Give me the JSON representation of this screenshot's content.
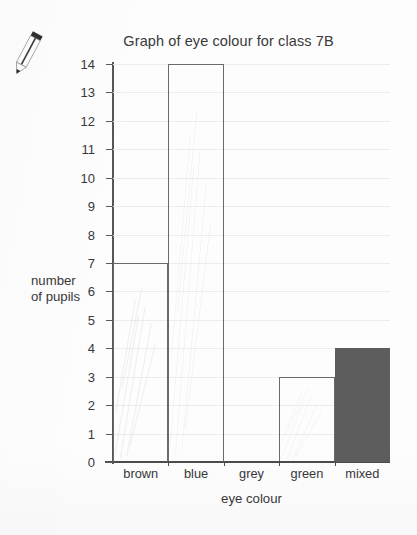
{
  "page": {
    "background_color": "#fdfdfd",
    "doodle_icon": "pencil-icon"
  },
  "chart_data": {
    "type": "bar",
    "title": "Graph of eye colour for class 7B",
    "xlabel": "eye colour",
    "ylabel_line1": "number",
    "ylabel_line2": "of pupils",
    "ylabel": "number of pupils",
    "categories": [
      "brown",
      "blue",
      "grey",
      "green",
      "mixed"
    ],
    "values": [
      7,
      14,
      0,
      3,
      4
    ],
    "ylim": [
      0,
      14
    ],
    "yticks": [
      0,
      1,
      2,
      3,
      4,
      5,
      6,
      7,
      8,
      9,
      10,
      11,
      12,
      13,
      14
    ],
    "ytick_labels": [
      "0",
      "1",
      "2",
      "3",
      "4",
      "5",
      "6",
      "7",
      "8",
      "9",
      "10",
      "11",
      "12",
      "13",
      "14"
    ],
    "grid": true,
    "legend": false,
    "bar_styles": [
      {
        "category": "brown",
        "fill": "none",
        "stroke": "#6a6a6c"
      },
      {
        "category": "blue",
        "fill": "none",
        "stroke": "#6a6a6c"
      },
      {
        "category": "grey",
        "fill": "none",
        "stroke": "#6a6a6c"
      },
      {
        "category": "green",
        "fill": "none",
        "stroke": "#6a6a6c"
      },
      {
        "category": "mixed",
        "fill": "#5d5d5d",
        "stroke": "#5d5d5d"
      }
    ],
    "colors": {
      "axis": "#4b4b4b",
      "grid": "#ececec",
      "outline": "#6a6a6c",
      "filled_bar": "#5d5d5d",
      "text": "#37373a"
    }
  }
}
